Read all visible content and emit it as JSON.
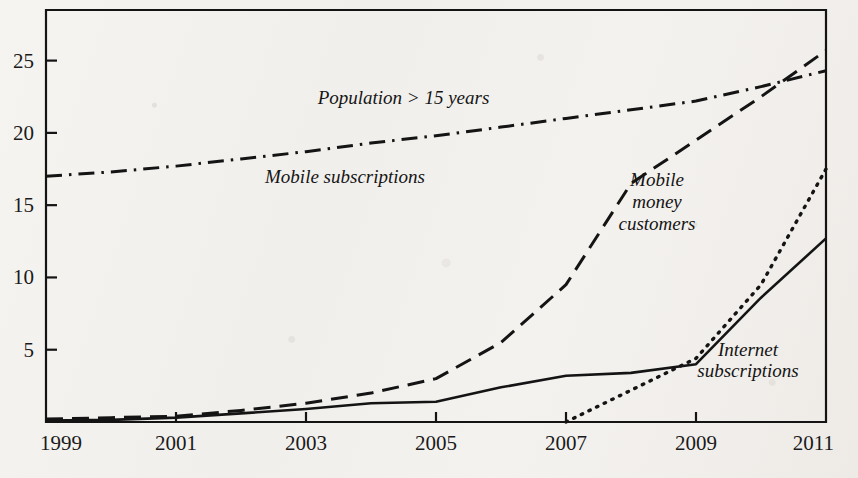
{
  "figure": {
    "name": "uganda-ict-adoption-chart",
    "background_color": "#f3f1ee",
    "ink_color": "#141414"
  },
  "chart_data": {
    "type": "line",
    "title": "",
    "subtitle": "",
    "xlabel": "",
    "ylabel": "",
    "xlim": [
      1999,
      2011
    ],
    "ylim": [
      0,
      28.5
    ],
    "grid": false,
    "legend_position": "inline-annotations",
    "x_tick_labels": [
      "1999",
      "2001",
      "2003",
      "2005",
      "2007",
      "2009",
      "2011"
    ],
    "x_tick_values": [
      1999,
      2001,
      2003,
      2005,
      2007,
      2009,
      2011
    ],
    "y_tick_labels": [
      "5",
      "10",
      "15",
      "20",
      "25"
    ],
    "y_tick_values": [
      5,
      10,
      15,
      20,
      25
    ],
    "x": [
      1999,
      2000,
      2001,
      2002,
      2003,
      2004,
      2005,
      2006,
      2007,
      2008,
      2009,
      2010,
      2011
    ],
    "series": [
      {
        "name": "Population > 15 years",
        "label": "Population > 15 years",
        "style": "dash-dot",
        "color": "#141414",
        "values": [
          17.0,
          17.3,
          17.7,
          18.2,
          18.7,
          19.3,
          19.8,
          20.4,
          21.0,
          21.6,
          22.2,
          23.2,
          24.3
        ]
      },
      {
        "name": "Mobile subscriptions",
        "label": "Mobile subscriptions",
        "style": "long-dash",
        "color": "#141414",
        "values": [
          0.2,
          0.3,
          0.4,
          0.8,
          1.3,
          2.0,
          3.0,
          5.5,
          9.5,
          16.5,
          19.5,
          22.5,
          25.7
        ]
      },
      {
        "name": "Mobile money customers",
        "label": "Mobile money customers",
        "style": "dotted",
        "color": "#141414",
        "values": [
          null,
          null,
          null,
          null,
          null,
          null,
          null,
          null,
          0.0,
          2.2,
          4.4,
          9.5,
          17.5
        ]
      },
      {
        "name": "Internet subscriptions",
        "label": "Internet subscriptions",
        "style": "solid",
        "color": "#141414",
        "values": [
          0.1,
          0.15,
          0.3,
          0.6,
          0.9,
          1.3,
          1.4,
          2.4,
          3.2,
          3.4,
          4.0,
          8.6,
          12.7
        ]
      }
    ],
    "annotations": [
      {
        "text": "Population > 15 years",
        "x": 2004.5,
        "y": 22.0
      },
      {
        "text": "Mobile subscriptions",
        "x": 2003.6,
        "y": 16.5
      },
      {
        "text": "Mobile",
        "x": 2008.4,
        "y": 16.3
      },
      {
        "text": "money",
        "x": 2008.4,
        "y": 14.8
      },
      {
        "text": "customers",
        "x": 2008.4,
        "y": 13.3
      },
      {
        "text": "Internet",
        "x": 2009.8,
        "y": 4.6
      },
      {
        "text": "subscriptions",
        "x": 2009.8,
        "y": 3.1
      }
    ]
  }
}
